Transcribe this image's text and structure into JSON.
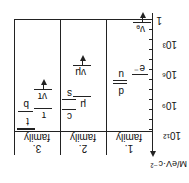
{
  "diagram": {
    "orientation": "rotated-180",
    "axis": {
      "label": "M/eV·c⁻²",
      "ticks": [
        "1",
        "10³",
        "10⁶",
        "10⁹",
        "10¹²"
      ]
    },
    "families": [
      {
        "label": "1.\nfamily",
        "l1": "1.",
        "l2": "family",
        "particles": [
          {
            "name": "νₑ",
            "upper_bound": true
          },
          {
            "name": "e⁻"
          },
          {
            "name": "u"
          },
          {
            "name": "d"
          }
        ]
      },
      {
        "label": "2.\nfamily",
        "l1": "2.",
        "l2": "family",
        "particles": [
          {
            "name": "νμ",
            "upper_bound": true
          },
          {
            "name": "μ"
          },
          {
            "name": "s"
          },
          {
            "name": "c"
          }
        ]
      },
      {
        "label": "3.\nfamily",
        "l1": "3.",
        "l2": "family",
        "particles": [
          {
            "name": "ντ",
            "upper_bound": true
          },
          {
            "name": "τ"
          },
          {
            "name": "b"
          },
          {
            "name": "t"
          }
        ]
      }
    ]
  }
}
